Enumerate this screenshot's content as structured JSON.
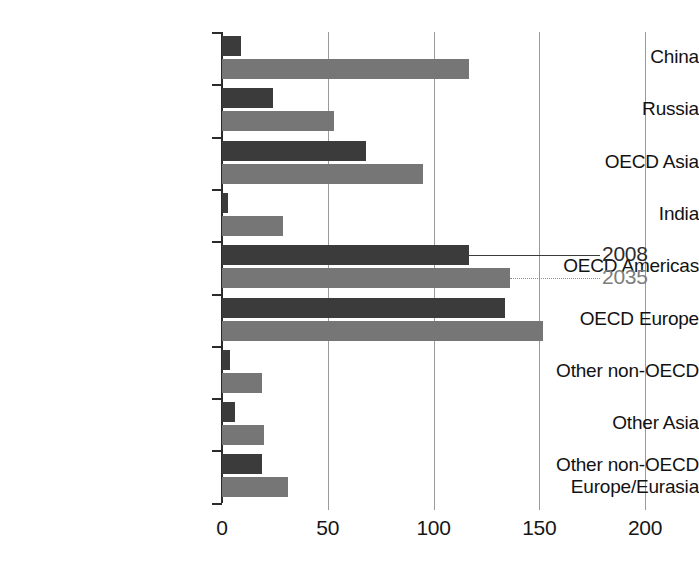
{
  "chart_data": {
    "type": "bar",
    "orientation": "horizontal",
    "title": "",
    "xlabel": "",
    "ylabel": "",
    "xlim": [
      0,
      200
    ],
    "xticks": [
      0,
      50,
      100,
      150,
      200
    ],
    "xtick_labels": [
      "0",
      "50",
      "100",
      "150",
      "200"
    ],
    "grid": true,
    "grid_axis": "x",
    "legend_position": "right-inline-annotation",
    "categories": [
      "China",
      "Russia",
      "OECD Asia",
      "India",
      "OECD Americas",
      "OECD Europe",
      "Other non-OECD",
      "Other Asia",
      "Other non-OECD Europe/Eurasia"
    ],
    "category_lines": [
      [
        "China"
      ],
      [
        "Russia"
      ],
      [
        "OECD Asia"
      ],
      [
        "India"
      ],
      [
        "OECD Americas"
      ],
      [
        "OECD Europe"
      ],
      [
        "Other non-OECD"
      ],
      [
        "Other Asia"
      ],
      [
        "Other non-OECD",
        "Europe/Eurasia"
      ]
    ],
    "series": [
      {
        "name": "2008",
        "color": "#3b3b3b",
        "values": [
          9,
          24,
          68,
          3,
          117,
          134,
          4,
          6,
          19
        ]
      },
      {
        "name": "2035",
        "color": "#767676",
        "values": [
          117,
          53,
          95,
          29,
          136,
          152,
          19,
          20,
          31
        ]
      }
    ],
    "annotations": [
      {
        "text": "2008",
        "series": "2008",
        "anchor_category": "OECD Americas",
        "style": "solid-leader"
      },
      {
        "text": "2035",
        "series": "2035",
        "anchor_category": "OECD Americas",
        "style": "dotted-leader"
      }
    ]
  }
}
